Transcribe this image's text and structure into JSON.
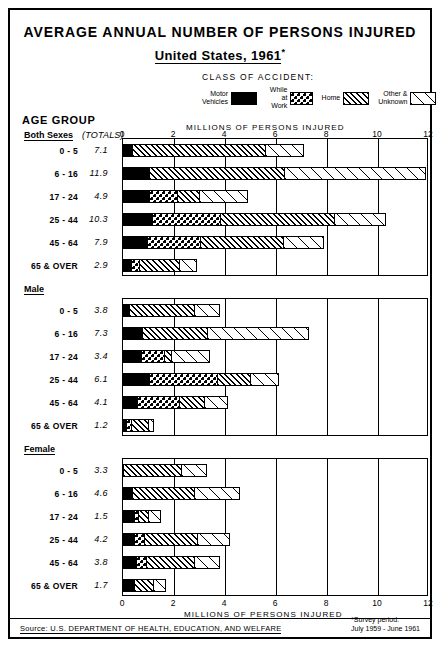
{
  "title": {
    "line1": "AVERAGE ANNUAL NUMBER OF PERSONS INJURED",
    "line2_pre": "United States,",
    "line2_year": "1961",
    "asterisk": "*"
  },
  "legend": {
    "heading": "CLASS OF ACCIDENT:",
    "items": [
      {
        "label": "Motor\nVehicles",
        "pattern": "solid-black",
        "key": "motor"
      },
      {
        "label": "While at\nWork",
        "pattern": "dotted-grid",
        "key": "work"
      },
      {
        "label": "Home",
        "pattern": "dense-diagonal-hatch",
        "key": "home"
      },
      {
        "label": "Other &\nUnknown",
        "pattern": "sparse-diagonal-hatch",
        "key": "other"
      }
    ]
  },
  "headers": {
    "age_group": "AGE GROUP",
    "totals": "(TOTALS)",
    "axis_title_top": "MILLIONS OF PERSONS INJURED",
    "axis_title_bottom": "MILLIONS OF PERSONS INJURED"
  },
  "footer": {
    "source": "Source: U.S. DEPARTMENT OF HEALTH, EDUCATION, AND WELFARE",
    "survey_note": "*Survey period:\nJuly 1959 - June 1961"
  },
  "chart_data": {
    "type": "bar",
    "orientation": "horizontal",
    "stacked": true,
    "xlabel": "MILLIONS OF PERSONS INJURED",
    "ylabel": "AGE GROUP",
    "xlim": [
      0,
      12
    ],
    "xticks": [
      0,
      2,
      4,
      6,
      8,
      10,
      12
    ],
    "xtick_labels": [
      "0",
      "2",
      "4",
      "6",
      "8",
      "10",
      "12"
    ],
    "grid": true,
    "units": "millions of persons",
    "series": [
      {
        "name": "Motor Vehicles",
        "key": "motor",
        "pattern": "solid-black"
      },
      {
        "name": "While at Work",
        "key": "work",
        "pattern": "dotted-grid"
      },
      {
        "name": "Home",
        "key": "home",
        "pattern": "dense-diagonal-hatch"
      },
      {
        "name": "Other & Unknown",
        "key": "other",
        "pattern": "sparse-diagonal-hatch"
      }
    ],
    "panels": [
      {
        "name": "Both Sexes",
        "rows": [
          {
            "category": "0 - 5",
            "total": "7.1",
            "segments": [
              0.3,
              0.0,
              5.3,
              1.5
            ]
          },
          {
            "category": "6 - 16",
            "total": "11.9",
            "segments": [
              1.0,
              0.0,
              5.3,
              5.6
            ]
          },
          {
            "category": "17 - 24",
            "total": "4.9",
            "segments": [
              1.0,
              1.1,
              0.9,
              1.9
            ]
          },
          {
            "category": "25 - 44",
            "total": "10.3",
            "segments": [
              1.1,
              2.7,
              4.5,
              2.0
            ]
          },
          {
            "category": "45 - 64",
            "total": "7.9",
            "segments": [
              0.9,
              2.1,
              3.3,
              1.6
            ]
          },
          {
            "category": "65 & OVER",
            "total": "2.9",
            "segments": [
              0.3,
              0.3,
              1.6,
              0.7
            ]
          }
        ]
      },
      {
        "name": "Male",
        "rows": [
          {
            "category": "0 - 5",
            "total": "3.8",
            "segments": [
              0.2,
              0.0,
              2.6,
              1.0
            ]
          },
          {
            "category": "6 - 16",
            "total": "7.3",
            "segments": [
              0.7,
              0.0,
              2.6,
              4.0
            ]
          },
          {
            "category": "17 - 24",
            "total": "3.4",
            "segments": [
              0.7,
              0.9,
              0.3,
              1.5
            ]
          },
          {
            "category": "25 - 44",
            "total": "6.1",
            "segments": [
              1.0,
              2.7,
              1.3,
              1.1
            ]
          },
          {
            "category": "45 - 64",
            "total": "4.1",
            "segments": [
              0.5,
              1.7,
              1.0,
              0.9
            ]
          },
          {
            "category": "65 & OVER",
            "total": "1.2",
            "segments": [
              0.1,
              0.2,
              0.7,
              0.2
            ]
          }
        ]
      },
      {
        "name": "Female",
        "rows": [
          {
            "category": "0 - 5",
            "total": "3.3",
            "segments": [
              0.0,
              0.0,
              2.3,
              1.0
            ]
          },
          {
            "category": "6 - 16",
            "total": "4.6",
            "segments": [
              0.3,
              0.0,
              2.5,
              1.8
            ]
          },
          {
            "category": "17 - 24",
            "total": "1.5",
            "segments": [
              0.4,
              0.2,
              0.4,
              0.5
            ]
          },
          {
            "category": "25 - 44",
            "total": "4.2",
            "segments": [
              0.4,
              0.4,
              2.1,
              1.3
            ]
          },
          {
            "category": "45 - 64",
            "total": "3.8",
            "segments": [
              0.5,
              0.4,
              1.9,
              1.0
            ]
          },
          {
            "category": "65 & OVER",
            "total": "1.7",
            "segments": [
              0.4,
              0.0,
              0.8,
              0.5
            ]
          }
        ]
      }
    ]
  }
}
